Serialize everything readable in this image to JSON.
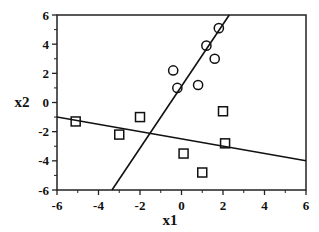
{
  "chart_data": {
    "type": "scatter",
    "title": "",
    "xlabel": "x1",
    "ylabel": "x2",
    "xlim": [
      -6,
      6
    ],
    "ylim": [
      -6,
      6
    ],
    "x_ticks": [
      -6,
      -4,
      -2,
      0,
      2,
      4,
      6
    ],
    "y_ticks": [
      -6,
      -4,
      -2,
      0,
      2,
      4,
      6
    ],
    "x_tick_labels": [
      "-6",
      "-4",
      "-2",
      "0",
      "2",
      "4",
      "6"
    ],
    "y_tick_labels": [
      "-6",
      "-4",
      "-2",
      "0",
      "2",
      "4",
      "6"
    ],
    "minor_ticks": [
      -5,
      -3,
      -1,
      1,
      3,
      5
    ],
    "grid": false,
    "legend": null,
    "series": [
      {
        "name": "circles",
        "marker": "circle",
        "points": [
          {
            "x": 1.8,
            "y": 5.1
          },
          {
            "x": 1.2,
            "y": 3.9
          },
          {
            "x": 1.6,
            "y": 3.0
          },
          {
            "x": -0.4,
            "y": 2.2
          },
          {
            "x": -0.2,
            "y": 1.0
          },
          {
            "x": 0.8,
            "y": 1.2
          }
        ]
      },
      {
        "name": "squares",
        "marker": "square",
        "points": [
          {
            "x": -5.1,
            "y": -1.3
          },
          {
            "x": -3.0,
            "y": -2.2
          },
          {
            "x": -2.0,
            "y": -1.0
          },
          {
            "x": 2.0,
            "y": -0.6
          },
          {
            "x": 2.1,
            "y": -2.8
          },
          {
            "x": 0.1,
            "y": -3.5
          },
          {
            "x": 1.0,
            "y": -4.8
          }
        ]
      }
    ],
    "lines": [
      {
        "name": "steep-boundary-line",
        "from": {
          "x": -3.35,
          "y": -6
        },
        "to": {
          "x": 2.3,
          "y": 6
        }
      },
      {
        "name": "shallow-boundary-line",
        "from": {
          "x": -6,
          "y": -1.0
        },
        "to": {
          "x": 6,
          "y": -4.0
        }
      }
    ]
  }
}
